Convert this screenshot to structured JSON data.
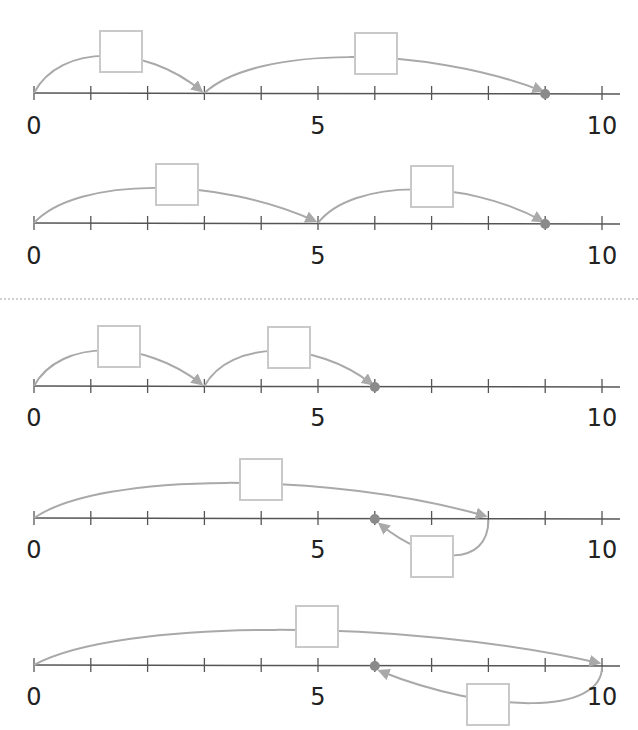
{
  "colors": {
    "axis": "#555555",
    "arc": "#a9a9a9",
    "dot": "#8a8a8a",
    "box": "#c9c9c9",
    "label": "#222222"
  },
  "labels": [
    "0",
    "5",
    "10"
  ],
  "lines": [
    {
      "axis_y": 93,
      "label_y": 112,
      "end_dot": 9,
      "jumps": [
        {
          "from": 0,
          "to": 3,
          "side": "above",
          "box": {
            "x": 99,
            "y": 30,
            "w": 44,
            "h": 43
          }
        },
        {
          "from": 3,
          "to": 9,
          "side": "above",
          "box": {
            "x": 354,
            "y": 32,
            "w": 44,
            "h": 43
          }
        }
      ]
    },
    {
      "axis_y": 223,
      "label_y": 242,
      "end_dot": 9,
      "jumps": [
        {
          "from": 0,
          "to": 5,
          "side": "above",
          "box": {
            "x": 155,
            "y": 163,
            "w": 44,
            "h": 43
          }
        },
        {
          "from": 5,
          "to": 9,
          "side": "above",
          "box": {
            "x": 410,
            "y": 165,
            "w": 44,
            "h": 43
          }
        }
      ]
    },
    {
      "axis_y": 386,
      "label_y": 404,
      "end_dot": 6,
      "jumps": [
        {
          "from": 0,
          "to": 3,
          "side": "above",
          "box": {
            "x": 97,
            "y": 325,
            "w": 44,
            "h": 43
          }
        },
        {
          "from": 3,
          "to": 6,
          "side": "above",
          "box": {
            "x": 267,
            "y": 326,
            "w": 44,
            "h": 43
          }
        }
      ]
    },
    {
      "axis_y": 518,
      "label_y": 536,
      "end_dot": 6,
      "jumps": [
        {
          "from": 0,
          "to": 8,
          "side": "above",
          "box": {
            "x": 239,
            "y": 458,
            "w": 44,
            "h": 43
          }
        },
        {
          "from": 8,
          "to": 6,
          "side": "below",
          "box": {
            "x": 410,
            "y": 535,
            "w": 44,
            "h": 43
          }
        }
      ]
    },
    {
      "axis_y": 665,
      "label_y": 683,
      "end_dot": 6,
      "jumps": [
        {
          "from": 0,
          "to": 10,
          "side": "above",
          "box": {
            "x": 295,
            "y": 605,
            "w": 44,
            "h": 43
          }
        },
        {
          "from": 10,
          "to": 6,
          "side": "below",
          "box": {
            "x": 466,
            "y": 683,
            "w": 44,
            "h": 43
          }
        }
      ]
    }
  ]
}
